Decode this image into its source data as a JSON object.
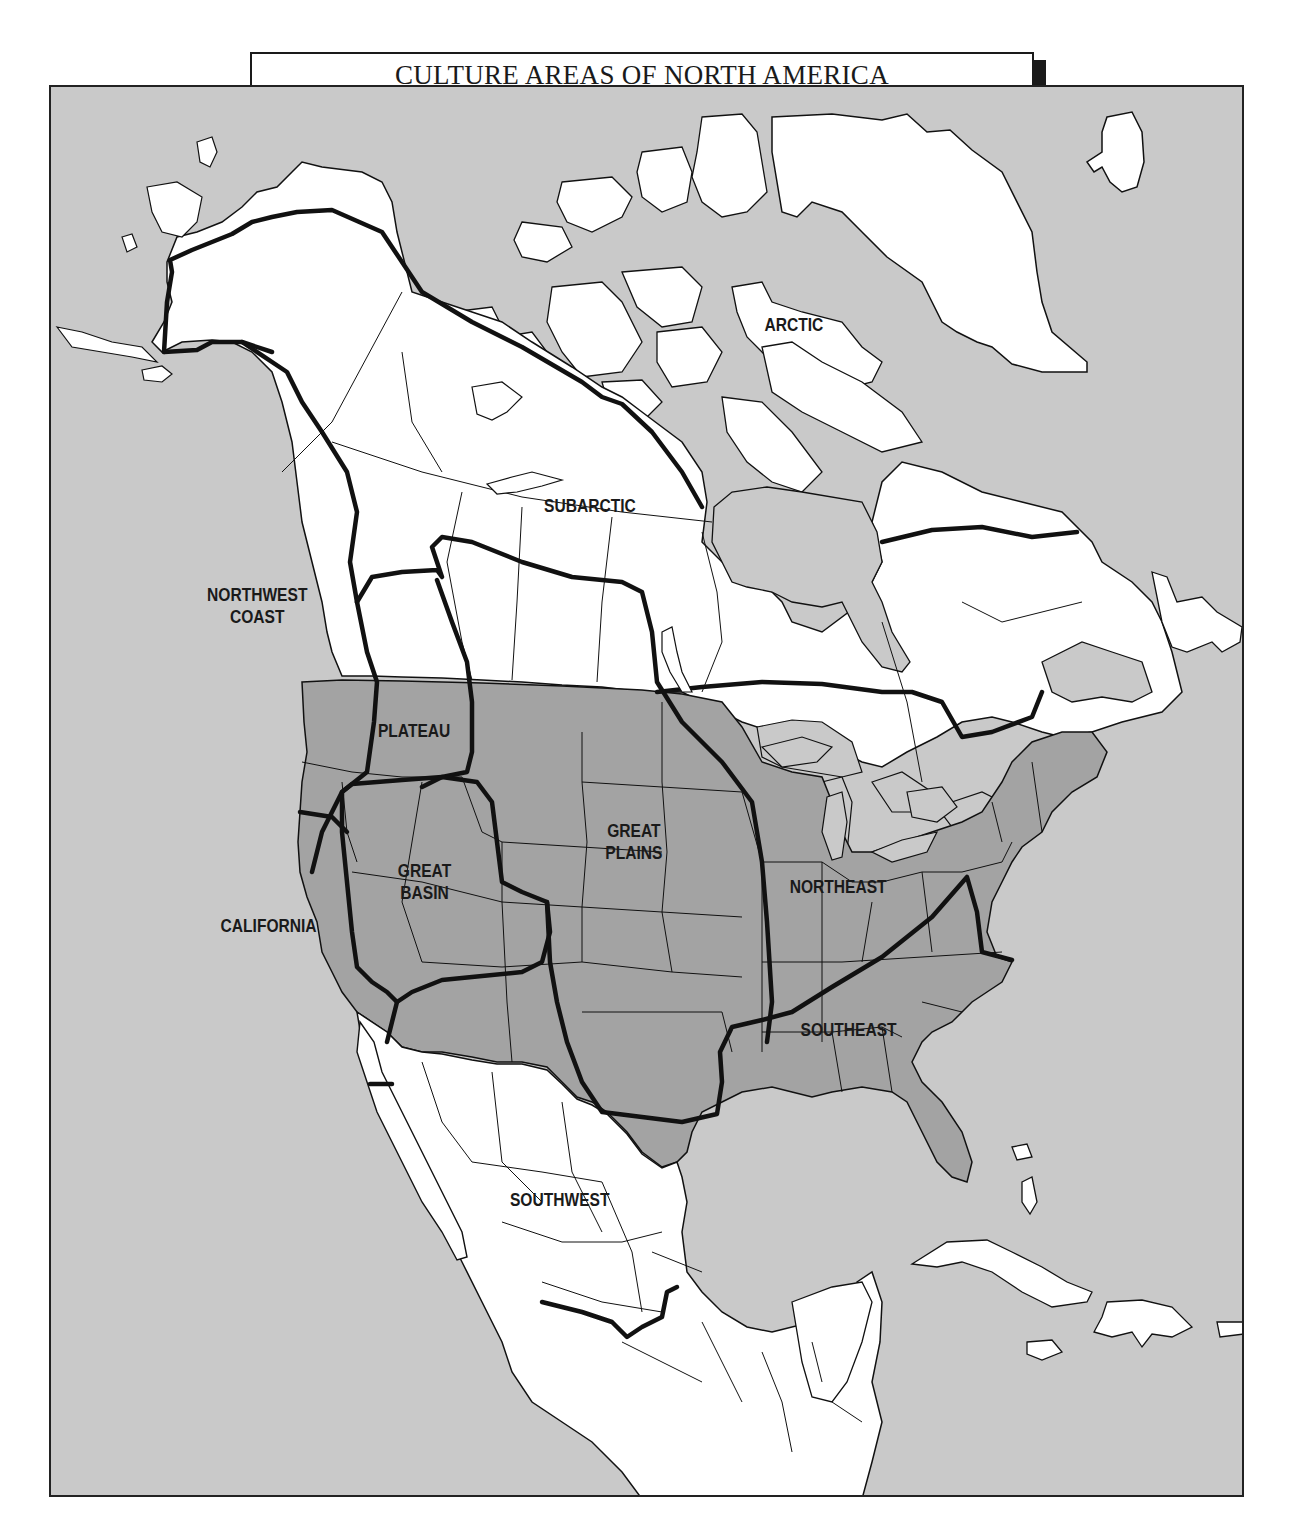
{
  "title": "CULTURE AREAS OF NORTH AMERICA",
  "colors": {
    "ocean": "#c9c9c9",
    "land_outside_us": "#ffffff",
    "united_states": "#a3a3a3",
    "great_lakes": "#c9c9c9",
    "boundary_line": "#111111",
    "frame": "#222222"
  },
  "culture_areas": [
    {
      "id": "arctic",
      "label": "ARCTIC"
    },
    {
      "id": "subarctic",
      "label": "SUBARCTIC"
    },
    {
      "id": "northwest-coast",
      "label_line1": "NORTHWEST",
      "label_line2": "COAST"
    },
    {
      "id": "plateau",
      "label": "PLATEAU"
    },
    {
      "id": "great-plains",
      "label_line1": "GREAT",
      "label_line2": "PLAINS"
    },
    {
      "id": "great-basin",
      "label_line1": "GREAT",
      "label_line2": "BASIN"
    },
    {
      "id": "california",
      "label": "CALIFORNIA"
    },
    {
      "id": "northeast",
      "label": "NORTHEAST"
    },
    {
      "id": "southeast",
      "label": "SOUTHEAST"
    },
    {
      "id": "southwest",
      "label": "SOUTHWEST"
    }
  ],
  "legend": {
    "shaded_region": "United States (darker gray)",
    "thick_lines": "Culture area boundaries",
    "thin_lines": "State / province boundaries"
  }
}
